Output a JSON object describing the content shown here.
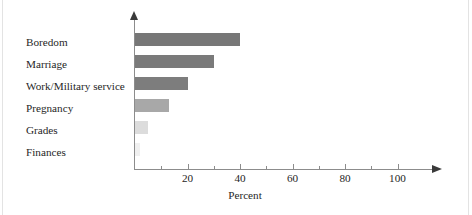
{
  "chart_data": {
    "type": "bar",
    "orientation": "horizontal",
    "title": "",
    "subtitle": "",
    "xlabel": "Percent",
    "ylabel": "",
    "categories": [
      "Boredom",
      "Marriage",
      "Work/Military service",
      "Pregnancy",
      "Grades",
      "Finances"
    ],
    "values": [
      40,
      30,
      20,
      13,
      5,
      2
    ],
    "series": [
      {
        "name": "Percent",
        "values": [
          40,
          30,
          20,
          13,
          5,
          2
        ]
      }
    ],
    "xlim": [
      0,
      110
    ],
    "ylim": [
      0,
      6
    ],
    "xticks": [
      0,
      10,
      20,
      30,
      40,
      50,
      60,
      70,
      80,
      90,
      100
    ],
    "xtick_labels": [
      "",
      "",
      "20",
      "",
      "40",
      "",
      "60",
      "",
      "80",
      "",
      "100"
    ],
    "labeled_xticks": [
      20,
      40,
      60,
      80,
      100
    ],
    "grid": false,
    "legend": false,
    "legend_position": "none",
    "bar_colors": [
      "#777777",
      "#7a7a7a",
      "#7d7d7d",
      "#a8a8a8",
      "#dcdcdc",
      "#f0f0f0"
    ],
    "axis_color": "#8c8c8c",
    "arrow_color": "#3a3a3a",
    "text_color": "#262626",
    "background": "#ffffff",
    "annotations": []
  },
  "labels": {
    "boredom": "Boredom",
    "marriage": "Marriage",
    "work_military": "Work/Military service",
    "pregnancy": "Pregnancy",
    "grades": "Grades",
    "finances": "Finances"
  },
  "axis": {
    "x_title": "Percent",
    "tick_20": "20",
    "tick_40": "40",
    "tick_60": "60",
    "tick_80": "80",
    "tick_100": "100"
  }
}
